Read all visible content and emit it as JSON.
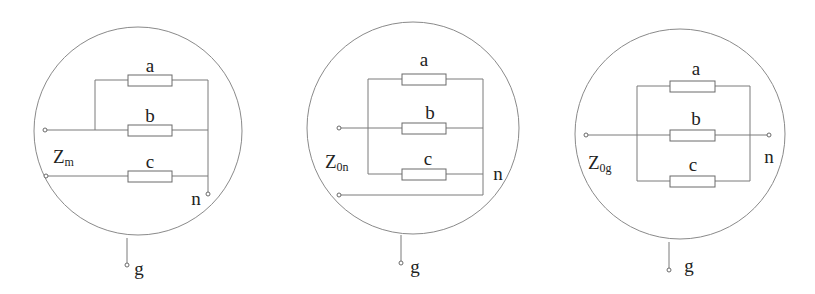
{
  "figure": {
    "colors": {
      "line": "#7a7a7a",
      "circle": "#8a8a8a",
      "text": "#222222",
      "background": "#ffffff"
    }
  },
  "diagrams": [
    {
      "id": "zm",
      "title_main": "Z",
      "title_sub": "m",
      "resistors": [
        {
          "label": "a"
        },
        {
          "label": "b"
        },
        {
          "label": "c"
        }
      ],
      "node_n": "n",
      "node_g": "g"
    },
    {
      "id": "z0n",
      "title_main": "Z",
      "title_sub": "0n",
      "resistors": [
        {
          "label": "a"
        },
        {
          "label": "b"
        },
        {
          "label": "c"
        }
      ],
      "node_n": "n",
      "node_g": "g"
    },
    {
      "id": "z0g",
      "title_main": "Z",
      "title_sub": "0g",
      "resistors": [
        {
          "label": "a"
        },
        {
          "label": "b"
        },
        {
          "label": "c"
        }
      ],
      "node_n": "n",
      "node_g": "g"
    }
  ]
}
